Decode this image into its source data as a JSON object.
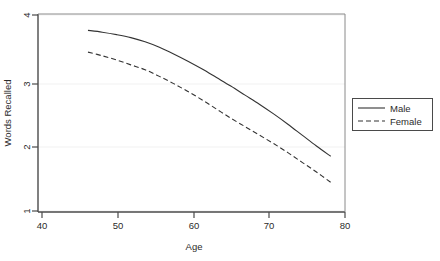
{
  "chart_data": {
    "type": "line",
    "title": "",
    "subtitle": "",
    "xlabel": "Age",
    "ylabel": "Words Recalled",
    "xlim": [
      38,
      81
    ],
    "ylim": [
      0.85,
      4.12
    ],
    "xticks": [
      40,
      50,
      60,
      70,
      80
    ],
    "xtick_labels": [
      "40",
      "50",
      "60",
      "70",
      "80"
    ],
    "yticks": [
      1,
      2,
      3,
      4
    ],
    "ytick_labels": [
      "1",
      "2",
      "3",
      "4"
    ],
    "grid": "horizontal",
    "legend_position": "right-outside",
    "series": [
      {
        "name": "Male",
        "style": "solid",
        "color": "#333333",
        "x": [
          45,
          47,
          49,
          51,
          53,
          55,
          57,
          59,
          61,
          63,
          65,
          67,
          69,
          71,
          73,
          75,
          77,
          79
        ],
        "values": [
          3.85,
          3.82,
          3.78,
          3.73,
          3.66,
          3.57,
          3.46,
          3.34,
          3.21,
          3.07,
          2.93,
          2.78,
          2.63,
          2.47,
          2.3,
          2.12,
          1.94,
          1.77
        ]
      },
      {
        "name": "Female",
        "style": "dashed",
        "color": "#333333",
        "x": [
          45,
          47,
          49,
          51,
          53,
          55,
          57,
          59,
          61,
          63,
          65,
          67,
          69,
          71,
          73,
          75,
          77,
          79
        ],
        "values": [
          3.49,
          3.43,
          3.36,
          3.28,
          3.2,
          3.09,
          2.97,
          2.84,
          2.7,
          2.55,
          2.4,
          2.26,
          2.12,
          1.98,
          1.83,
          1.67,
          1.51,
          1.34
        ]
      }
    ]
  },
  "legend": {
    "entries": [
      {
        "label": "Male",
        "style": "solid"
      },
      {
        "label": "Female",
        "style": "dashed"
      }
    ]
  },
  "axes": {
    "x_title": "Age",
    "y_title": "Words Recalled"
  }
}
